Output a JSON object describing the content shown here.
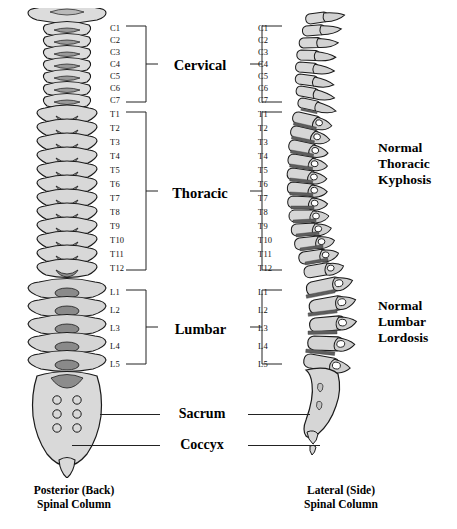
{
  "figure": {
    "type": "anatomical-diagram"
  },
  "vertebrae": {
    "cervical": [
      "C1",
      "C2",
      "C3",
      "C4",
      "C5",
      "C6",
      "C7"
    ],
    "thoracic": [
      "T1",
      "T2",
      "T3",
      "T4",
      "T5",
      "T6",
      "T7",
      "T8",
      "T9",
      "T10",
      "T11",
      "T12"
    ],
    "lumbar": [
      "L1",
      "L2",
      "L3",
      "L4",
      "L5"
    ]
  },
  "regions": {
    "cervical": "Cervical",
    "thoracic": "Thoracic",
    "lumbar": "Lumbar",
    "sacrum": "Sacrum",
    "coccyx": "Coccyx"
  },
  "annotations": {
    "kyphosis": {
      "line1": "Normal",
      "line2": "Thoracic",
      "line3": "Kyphosis"
    },
    "lordosis": {
      "line1": "Normal",
      "line2": "Lumbar",
      "line3": "Lordosis"
    }
  },
  "captions": {
    "left": {
      "line1": "Posterior (Back)",
      "line2": "Spinal Column"
    },
    "right": {
      "line1": "Lateral (Side)",
      "line2": "Spinal Column"
    }
  },
  "colors": {
    "bone_fill": "#d4d4d4",
    "bone_light": "#e4e4e4",
    "bone_shadow": "#8f8f8f",
    "disc": "#5e5e5e",
    "outline": "#1a1a1a",
    "text": "#111111",
    "background": "#ffffff"
  }
}
